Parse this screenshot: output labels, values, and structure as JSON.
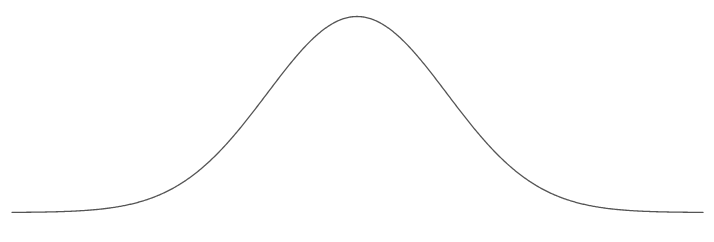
{
  "page": {
    "background_color": "#ffffff",
    "width": 714,
    "height": 242
  },
  "chart_data": {
    "type": "line",
    "title": "",
    "subtitle": "",
    "xlabel": "",
    "ylabel": "",
    "legend": [],
    "annotations": [],
    "grid": false,
    "axes_visible": false,
    "tick_labels_x": [],
    "tick_labels_y": [],
    "xlim": [
      12,
      703
    ],
    "ylim": [
      212,
      16
    ],
    "series": [
      {
        "name": "gaussian",
        "color": "#555555",
        "line_width": 1.3,
        "shape": "gaussian",
        "peak_x": 357,
        "peak_y": 16.5,
        "baseline_y": 212.5,
        "amplitude": 196,
        "sigma": 90,
        "x_start": 12,
        "x_end": 703,
        "x": [
          12,
          32,
          52,
          72,
          92,
          112,
          132,
          152,
          172,
          192,
          212,
          232,
          252,
          272,
          292,
          312,
          332,
          352,
          372,
          392,
          412,
          432,
          452,
          472,
          492,
          512,
          532,
          552,
          572,
          592,
          612,
          632,
          652,
          672,
          692,
          703
        ],
        "y": [
          212.1,
          211.8,
          211.2,
          210.3,
          208.9,
          206.6,
          203.2,
          198.1,
          191.0,
          181.3,
          168.6,
          152.9,
          134.4,
          114.2,
          93.6,
          74.2,
          57.9,
          46.0,
          39.5,
          38.8,
          43.9,
          54.3,
          69.2,
          87.2,
          106.8,
          126.3,
          144.4,
          160.2,
          173.3,
          183.6,
          191.5,
          197.4,
          201.6,
          204.6,
          206.7,
          207.5
        ]
      }
    ]
  }
}
